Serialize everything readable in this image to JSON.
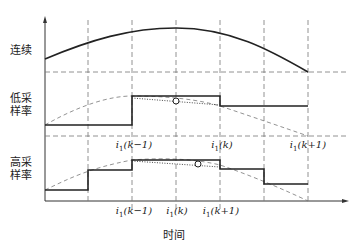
{
  "rows": {
    "continuous": {
      "label": "连续"
    },
    "low_rate": {
      "label_line1": "低采",
      "label_line2": "样率"
    },
    "high_rate": {
      "label_line1": "高采",
      "label_line2": "样率"
    }
  },
  "xaxis": {
    "label": "时间"
  },
  "low_rate_ticks": [
    {
      "base": "i",
      "sub": "1",
      "arg": "(k−1)"
    },
    {
      "base": "i",
      "sub": "1",
      "arg": "(k)"
    },
    {
      "base": "i",
      "sub": "1",
      "arg": "(k+1)"
    }
  ],
  "high_rate_ticks": [
    {
      "base": "i",
      "sub": "1",
      "arg": "(k−1)"
    },
    {
      "base": "i",
      "sub": "1",
      "arg": "(k)"
    },
    {
      "base": "i",
      "sub": "1",
      "arg": "(k+1)"
    }
  ],
  "colors": {
    "line": "#222222",
    "dash": "#777777"
  }
}
